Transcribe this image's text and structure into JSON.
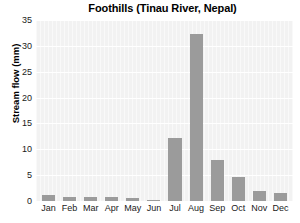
{
  "chart_data": {
    "type": "bar",
    "title": "Foothills (Tinau River, Nepal)",
    "xlabel": "",
    "ylabel": "Stream flow (mm)",
    "categories": [
      "Jan",
      "Feb",
      "Mar",
      "Apr",
      "May",
      "Jun",
      "Jul",
      "Aug",
      "Sep",
      "Oct",
      "Nov",
      "Dec"
    ],
    "values": [
      1.2,
      0.8,
      0.8,
      0.8,
      0.5,
      0.15,
      12.2,
      32.3,
      8.0,
      4.6,
      2.0,
      1.5
    ],
    "ylim": [
      0,
      35
    ],
    "yticks": [
      0,
      5,
      10,
      15,
      20,
      25,
      30,
      35
    ],
    "ytick_labels": [
      "0",
      "5",
      "10",
      "15",
      "20",
      "25",
      "30",
      "35"
    ],
    "grid": "horizontal",
    "legend": "none",
    "bar_color": "#9b9b9b",
    "plot_background": "#f2f2f2",
    "gridline_color": "#ffffff",
    "text_color": "#1a1a1a"
  }
}
